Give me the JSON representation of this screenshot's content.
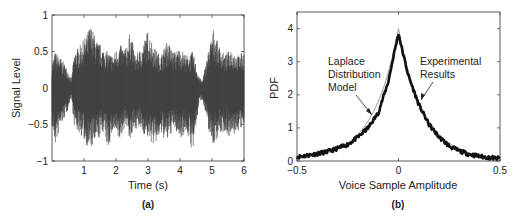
{
  "chart_data": [
    {
      "id": "a",
      "type": "line",
      "title": "",
      "caption": "(a)",
      "xlabel": "Time (s)",
      "ylabel": "Signal Level",
      "xlim": [
        0,
        6
      ],
      "ylim": [
        -1,
        1
      ],
      "xticks": [
        1,
        2,
        3,
        4,
        5,
        6
      ],
      "xtick_labels": [
        "1",
        "2",
        "3",
        "4",
        "5",
        "6"
      ],
      "yticks": [
        -1,
        -0.5,
        0,
        0.5,
        1
      ],
      "ytick_labels": [
        "−1",
        "−0.5",
        "0",
        "0.5",
        "1"
      ],
      "grid": false,
      "series": [
        {
          "name": "Voice signal waveform",
          "color": "#3a3a3a",
          "envelope": {
            "t": [
              0.0,
              0.1,
              0.3,
              0.5,
              0.6,
              0.7,
              0.9,
              1.1,
              1.2,
              1.4,
              1.6,
              1.75,
              1.9,
              2.1,
              2.3,
              2.45,
              2.6,
              2.8,
              3.0,
              3.2,
              3.4,
              3.6,
              3.8,
              4.0,
              4.2,
              4.4,
              4.6,
              4.7,
              4.9,
              5.05,
              5.2,
              5.4,
              5.6,
              5.8,
              6.0
            ],
            "upper": [
              0.35,
              0.5,
              0.4,
              0.25,
              0.1,
              0.5,
              0.6,
              0.75,
              0.88,
              0.65,
              0.55,
              0.5,
              0.45,
              0.6,
              0.55,
              0.78,
              0.45,
              0.55,
              0.8,
              0.55,
              0.45,
              0.65,
              0.5,
              0.55,
              0.45,
              0.5,
              0.15,
              0.1,
              0.55,
              0.82,
              0.6,
              0.45,
              0.55,
              0.45,
              0.5
            ],
            "lower": [
              -0.55,
              -0.8,
              -0.5,
              -0.3,
              -0.1,
              -0.55,
              -0.65,
              -0.8,
              -0.85,
              -0.75,
              -0.6,
              -0.85,
              -0.6,
              -0.75,
              -0.5,
              -0.75,
              -0.55,
              -0.6,
              -0.7,
              -0.8,
              -0.65,
              -0.75,
              -0.55,
              -0.7,
              -0.6,
              -0.9,
              -0.2,
              -0.15,
              -0.6,
              -0.8,
              -0.65,
              -0.6,
              -0.7,
              -0.6,
              -0.55
            ]
          }
        }
      ]
    },
    {
      "id": "b",
      "type": "line",
      "title": "",
      "caption": "(b)",
      "xlabel": "Voice Sample Amplitude",
      "ylabel": "PDF",
      "xlim": [
        -0.5,
        0.5
      ],
      "ylim": [
        0,
        4.5
      ],
      "xticks": [
        -0.5,
        0,
        0.5
      ],
      "xtick_labels": [
        "−0.5",
        "0",
        "0.5"
      ],
      "yticks": [
        0,
        1,
        2,
        3,
        4
      ],
      "ytick_labels": [
        "0",
        "1",
        "2",
        "3",
        "4"
      ],
      "grid": false,
      "series": [
        {
          "name": "Experimental Results",
          "color": "#111111",
          "x": [
            -0.5,
            -0.45,
            -0.4,
            -0.35,
            -0.3,
            -0.25,
            -0.2,
            -0.15,
            -0.1,
            -0.05,
            -0.02,
            0.0,
            0.02,
            0.05,
            0.1,
            0.15,
            0.2,
            0.25,
            0.3,
            0.35,
            0.4,
            0.45,
            0.5
          ],
          "y": [
            0.12,
            0.17,
            0.22,
            0.28,
            0.38,
            0.5,
            0.72,
            1.0,
            1.45,
            2.4,
            3.3,
            3.85,
            3.3,
            2.55,
            1.7,
            1.1,
            0.72,
            0.45,
            0.3,
            0.2,
            0.14,
            0.1,
            0.07
          ]
        },
        {
          "name": "Laplace Distribution Model",
          "color": "#9a9a9a",
          "model": "laplace",
          "peak": 4.0,
          "scale": 0.125
        }
      ],
      "annotations": [
        {
          "text": [
            "Laplace",
            "Distribution",
            "Model"
          ],
          "target": "Laplace Distribution Model",
          "arrow_to": [
            -0.1,
            1.4
          ]
        },
        {
          "text": [
            "Experimental",
            "Results"
          ],
          "target": "Experimental Results",
          "arrow_to": [
            0.12,
            1.7
          ]
        }
      ]
    }
  ]
}
